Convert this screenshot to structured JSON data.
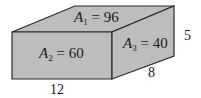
{
  "diagram": {
    "type": "rectangular-prism",
    "colors": {
      "face_fill": "#bdbdbd",
      "edge_stroke": "#2a2a2a",
      "background": "#ffffff",
      "text": "#1a1a1a"
    },
    "faces": {
      "top": {
        "var": "A",
        "sub": "1",
        "eq": " = 96",
        "value": 96
      },
      "front": {
        "var": "A",
        "sub": "2",
        "eq": " = 60",
        "value": 60
      },
      "side": {
        "var": "A",
        "sub": "3",
        "eq": " = 40",
        "value": 40
      }
    },
    "dimensions": {
      "length": "12",
      "depth": "8",
      "height": "5"
    }
  }
}
